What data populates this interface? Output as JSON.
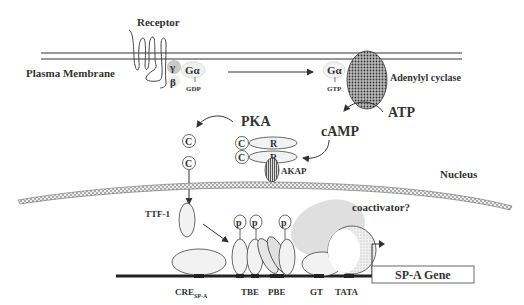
{
  "diagram": {
    "labels": {
      "receptor": "Receptor",
      "plasma_membrane": "Plasma Membrane",
      "gamma": "γ",
      "beta": "β",
      "galpha_gdp": "Gα",
      "gdp": "GDP",
      "galpha_gtp": "Gα",
      "gtp": "GTP",
      "adenylyl_cyclase": "Adenylyl cyclase",
      "atp": "ATP",
      "camp": "cAMP",
      "pka": "PKA",
      "c": "C",
      "r": "R",
      "akap": "AKAP",
      "nucleus": "Nucleus",
      "ttf1": "TTF-1",
      "p": "p",
      "coactivator": "coactivator?",
      "cre": "CRE",
      "cre_sub": "SP-A",
      "tbe": "TBE",
      "pbe": "PBE",
      "gt": "GT",
      "tata": "TATA",
      "gene": "SP-A Gene"
    },
    "colors": {
      "line": "#333333",
      "protein_fill": "#f2f2f2",
      "gamma_fill": "#c8c8c8",
      "coactivator_fill": "#d9d9d9"
    }
  }
}
